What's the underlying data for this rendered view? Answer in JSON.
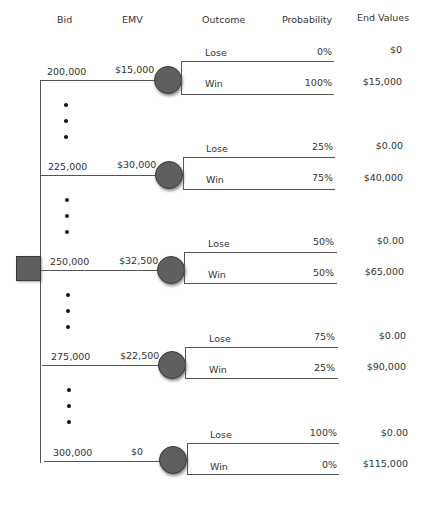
{
  "headers": {
    "bid": "Bid",
    "emv": "EMV",
    "outcome": "Outcome",
    "probability": "Probability",
    "end_values": "End Values"
  },
  "branches": [
    {
      "bid": "200,000",
      "emv": "$15,000",
      "lose": {
        "label": "Lose",
        "probability": "0%",
        "end_value": "$0"
      },
      "win": {
        "label": "Win",
        "probability": "100%",
        "end_value": "$15,000"
      }
    },
    {
      "bid": "225,000",
      "emv": "$30,000",
      "lose": {
        "label": "Lose",
        "probability": "25%",
        "end_value": "$0.00"
      },
      "win": {
        "label": "Win",
        "probability": "75%",
        "end_value": "$40,000"
      }
    },
    {
      "bid": "250,000",
      "emv": "$32,500",
      "lose": {
        "label": "Lose",
        "probability": "50%",
        "end_value": "$0.00"
      },
      "win": {
        "label": "Win",
        "probability": "50%",
        "end_value": "$65,000"
      }
    },
    {
      "bid": "275,000",
      "emv": "$22,500",
      "lose": {
        "label": "Lose",
        "probability": "75%",
        "end_value": "$0.00"
      },
      "win": {
        "label": "Win",
        "probability": "25%",
        "end_value": "$90,000"
      }
    },
    {
      "bid": "300,000",
      "emv": "$0",
      "lose": {
        "label": "Lose",
        "probability": "100%",
        "end_value": "$0.00"
      },
      "win": {
        "label": "Win",
        "probability": "0%",
        "end_value": "$115,000"
      }
    }
  ],
  "node_colors": {
    "decision": "#5f5f5f",
    "chance": "#5f5f5f"
  },
  "icons": {
    "decision_node": "square",
    "chance_node": "circle",
    "ellipsis": "vertical-dots"
  }
}
